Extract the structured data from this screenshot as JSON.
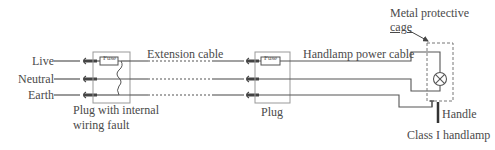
{
  "diagram": {
    "conductors": [
      "Live",
      "Neutral",
      "Earth"
    ],
    "labels": {
      "extension_cable": "Extension cable",
      "handlamp_power_cable": "Handlamp power cable",
      "metal_cage_line1": "Metal protective",
      "metal_cage_line2": "cage",
      "plug_fault_line1": "Plug with internal",
      "plug_fault_line2": "wiring fault",
      "plug": "Plug",
      "handle": "Handle",
      "class_handlamp": "Class I handlamp",
      "fuse_left": "Fuse",
      "fuse_right": "Fuse"
    },
    "components": [
      "plug-with-internal-wiring-fault",
      "extension-cable",
      "plug",
      "handlamp-power-cable",
      "lamp",
      "metal-protective-cage",
      "handle"
    ],
    "colors": {
      "line": "#555555",
      "box": "#999999",
      "text": "#4a4a4a"
    }
  }
}
